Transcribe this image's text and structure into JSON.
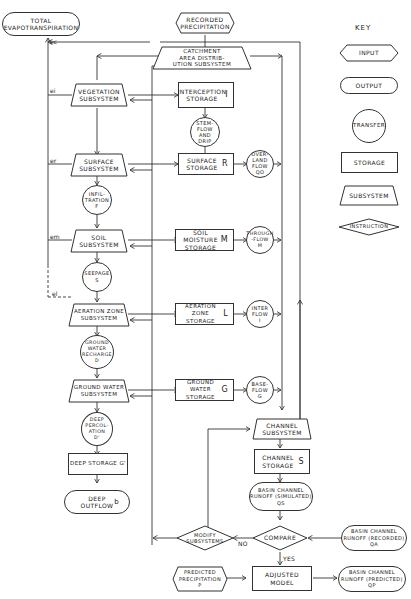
{
  "key": {
    "title": "KEY",
    "items": [
      {
        "shape": "input",
        "label": "INPUT"
      },
      {
        "shape": "output",
        "label": "OUTPUT"
      },
      {
        "shape": "transfer",
        "label": "TRANSFER"
      },
      {
        "shape": "storage",
        "label": "STORAGE"
      },
      {
        "shape": "subsystem",
        "label": "SUBSYSTEM"
      },
      {
        "shape": "instruction",
        "label": "INSTRUCTION"
      }
    ]
  },
  "outputs": {
    "total_evapotranspiration": "TOTAL\nEVAPOTRANSPIRATION",
    "deep_outflow": "DEEP\nOUTFLOW",
    "deep_outflow_sym": "b",
    "basin_runoff_simulated": "BASIN CHANNEL\nRUNOFF (SIMULATED)\nqs",
    "basin_runoff_recorded": "BASIN CHANNEL\nRUNOFF (RECORDED)\nqa",
    "basin_runoff_predicted": "BASIN CHANNEL\nRUNOFF (PREDICTED)\nqp"
  },
  "inputs": {
    "recorded_precipitation": "RECORDED\nPRECIPITATION",
    "predicted_precipitation": "PREDICTED\nPRECIPITATION\nP"
  },
  "subsystems": {
    "catchment": "CATCHMENT\nAREA DISTRIB-\nUTION SUBSYSTEM",
    "vegetation": "VEGETATION\nSUBSYSTEM",
    "surface": "SURFACE\nSUBSYSTEM",
    "soil": "SOIL\nSUBSYSTEM",
    "aeration": "AERATION ZONE\nSUBSYSTEM",
    "groundwater": "GROUND WATER\nSUBSYSTEM",
    "channel": "CHANNEL\nSUBSYSTEM"
  },
  "storages": {
    "interception": {
      "label": "INTERCEPTION\nSTORAGE",
      "sym": "I"
    },
    "surface": {
      "label": "SURFACE\nSTORAGE",
      "sym": "R"
    },
    "soil_moisture": {
      "label": "SOIL MOISTURE\nSTORAGE",
      "sym": "M"
    },
    "aeration": {
      "label": "AERATION ZONE\nSTORAGE",
      "sym": "L"
    },
    "groundwater": {
      "label": "GROUND WATER\nSTORAGE",
      "sym": "G"
    },
    "deep": {
      "label": "DEEP STORAGE  G'"
    },
    "channel": {
      "label": "CHANNEL\nSTORAGE",
      "sym": "S"
    },
    "adjusted_model": {
      "label": "ADJUSTED\nMODEL"
    }
  },
  "transfers": {
    "stemflow": "STEM-\nFLOW\nAND\nDRIP",
    "infiltration": "INFIL-\nTRATION\nf",
    "seepage": "SEEPAGE\ns",
    "gw_recharge": "GROUND\nWATER\nRECHARGE\nd",
    "deep_percolation": "DEEP\nPERCOL-\nATION\nd'",
    "overland_flow": "OVER-\nLAND\nFLOW\nqo",
    "throughflow": "THROUGH\n-FLOW\nm",
    "interflow": "INTER\nFLOW\ni",
    "baseflow": "BASE-\nFLOW\ng"
  },
  "instructions": {
    "compare": "COMPARE",
    "modify": "MODIFY\nSUBSYSTEMS"
  },
  "edge_labels": {
    "ec": "ec",
    "ei": "ei",
    "er": "er",
    "em": "em",
    "el": "el",
    "yes": "YES",
    "no": "NO"
  },
  "colors": {
    "line": "#333333",
    "background": "#ffffff"
  }
}
